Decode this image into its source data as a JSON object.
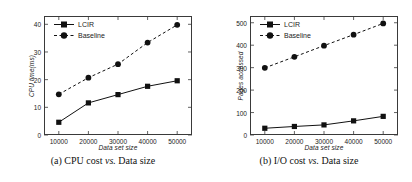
{
  "figure": {
    "panels": [
      {
        "caption_prefix": "(a) CPU cost ",
        "caption_vs": "vs.",
        "caption_suffix": " Data size",
        "legend": [
          {
            "label": "LCIR",
            "marker": "square",
            "dash": "solid",
            "color": "#111111"
          },
          {
            "label": "Baseline",
            "marker": "circle",
            "dash": "dashed",
            "color": "#111111"
          }
        ],
        "chart_data": {
          "type": "line",
          "title": "(a) CPU cost vs. Data size",
          "xlabel": "Data set size",
          "ylabel": "CPU time(ms)",
          "x": [
            10000,
            20000,
            30000,
            40000,
            50000
          ],
          "xtick_labels": [
            "10000",
            "20000",
            "30000",
            "40000",
            "50000"
          ],
          "ytick_labels": [
            "0",
            "10",
            "20",
            "30",
            "40"
          ],
          "yticks": [
            0,
            10,
            20,
            30,
            40
          ],
          "xlim": [
            5000,
            55000
          ],
          "ylim": [
            0,
            43
          ],
          "grid": false,
          "legend_position": "top-left",
          "series": [
            {
              "name": "LCIR",
              "values": [
                4.6,
                11.6,
                14.6,
                17.6,
                19.6
              ]
            },
            {
              "name": "Baseline",
              "values": [
                14.7,
                20.7,
                25.6,
                33.4,
                39.8
              ]
            }
          ]
        }
      },
      {
        "caption_prefix": "(b) I/O cost ",
        "caption_vs": "vs.",
        "caption_suffix": " Data size",
        "legend": [
          {
            "label": "LCIR",
            "marker": "square",
            "dash": "solid",
            "color": "#111111"
          },
          {
            "label": "Baseline",
            "marker": "circle",
            "dash": "dashed",
            "color": "#111111"
          }
        ],
        "chart_data": {
          "type": "line",
          "title": "(b) I/O cost vs. Data size",
          "xlabel": "Data set size",
          "ylabel": "Pages accessed",
          "x": [
            10000,
            20000,
            30000,
            40000,
            50000
          ],
          "xtick_labels": [
            "10000",
            "20000",
            "30000",
            "40000",
            "50000"
          ],
          "ytick_labels": [
            "0",
            "100",
            "200",
            "300",
            "400",
            "500"
          ],
          "yticks": [
            0,
            100,
            200,
            300,
            400,
            500
          ],
          "xlim": [
            5000,
            55000
          ],
          "ylim": [
            0,
            530
          ],
          "grid": false,
          "legend_position": "top-left",
          "series": [
            {
              "name": "LCIR",
              "values": [
                30,
                38,
                45,
                63,
                83
              ]
            },
            {
              "name": "Baseline",
              "values": [
                299,
                348,
                398,
                447,
                497
              ]
            }
          ]
        }
      }
    ]
  }
}
